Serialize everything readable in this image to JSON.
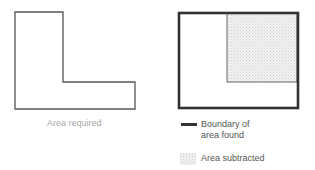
{
  "figure_left": {
    "caption": "Area required"
  },
  "figure_right": {
    "legend": [
      {
        "icon": "thick-line",
        "line1": "Boundary of",
        "line2": "area found"
      },
      {
        "icon": "shaded-swatch",
        "line1": "Area subtracted"
      }
    ]
  },
  "colors": {
    "outline": "#555555",
    "thick_outline": "#333333",
    "shade": "#e6e6e6",
    "caption": "#a8a8a8"
  }
}
